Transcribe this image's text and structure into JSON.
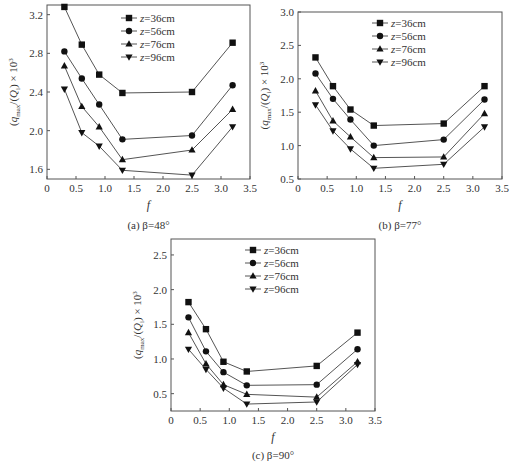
{
  "figure": {
    "panels": [
      "a",
      "b",
      "c"
    ]
  },
  "chart_data": [
    {
      "type": "line",
      "caption": "(a) β=48°",
      "xlabel": "f",
      "ylabel": "(q_max/Q_i) × 10^3",
      "xlim": [
        0,
        3.5
      ],
      "ylim": [
        1.5,
        3.3
      ],
      "xticks": [
        "0",
        "0.5",
        "1.0",
        "1.5",
        "2.0",
        "2.5",
        "3.0",
        "3.5"
      ],
      "yticks": [
        "1.6",
        "2.0",
        "2.4",
        "2.8",
        "3.2"
      ],
      "grid": false,
      "legend_position": "upper center",
      "x": [
        0.3,
        0.6,
        0.9,
        1.3,
        2.5,
        3.2
      ],
      "series": [
        {
          "name": "z=36cm",
          "marker": "square",
          "values": [
            3.28,
            2.89,
            2.58,
            2.39,
            2.4,
            2.91
          ]
        },
        {
          "name": "z=56cm",
          "marker": "circle",
          "values": [
            2.82,
            2.54,
            2.27,
            1.91,
            1.95,
            2.47
          ]
        },
        {
          "name": "z=76cm",
          "marker": "triangle-up",
          "values": [
            2.67,
            2.25,
            2.04,
            1.7,
            1.8,
            2.22
          ]
        },
        {
          "name": "z=96cm",
          "marker": "triangle-down",
          "values": [
            2.43,
            1.98,
            1.84,
            1.59,
            1.54,
            2.04
          ]
        }
      ]
    },
    {
      "type": "line",
      "caption": "(b) β=77°",
      "xlabel": "f",
      "ylabel": "(q_max/Q_i) × 10^3",
      "xlim": [
        0,
        3.5
      ],
      "ylim": [
        0.5,
        3.0
      ],
      "xticks": [
        "0",
        "0.5",
        "1.0",
        "1.5",
        "2.0",
        "2.5",
        "3.0",
        "3.5"
      ],
      "yticks": [
        "0.5",
        "1.0",
        "1.5",
        "2.0",
        "2.5",
        "3.0"
      ],
      "grid": false,
      "legend_position": "upper center",
      "x": [
        0.3,
        0.6,
        0.9,
        1.3,
        2.5,
        3.2
      ],
      "series": [
        {
          "name": "z=36cm",
          "marker": "square",
          "values": [
            2.32,
            1.89,
            1.54,
            1.3,
            1.33,
            1.89
          ]
        },
        {
          "name": "z=56cm",
          "marker": "circle",
          "values": [
            2.08,
            1.7,
            1.39,
            1.0,
            1.09,
            1.69
          ]
        },
        {
          "name": "z=76cm",
          "marker": "triangle-up",
          "values": [
            1.82,
            1.37,
            1.13,
            0.82,
            0.83,
            1.48
          ]
        },
        {
          "name": "z=96cm",
          "marker": "triangle-down",
          "values": [
            1.61,
            1.22,
            0.95,
            0.66,
            0.72,
            1.28
          ]
        }
      ]
    },
    {
      "type": "line",
      "caption": "(c) β=90°",
      "xlabel": "f",
      "ylabel": "(q_max/Q_i) × 10^3",
      "xlim": [
        0,
        3.5
      ],
      "ylim": [
        0.25,
        2.73
      ],
      "xticks": [
        "0",
        "0.5",
        "1.0",
        "1.5",
        "2.0",
        "2.5",
        "3.0",
        "3.5"
      ],
      "yticks": [
        "0.5",
        "1.0",
        "1.5",
        "2.0",
        "2.5"
      ],
      "grid": false,
      "legend_position": "upper center",
      "x": [
        0.3,
        0.6,
        0.9,
        1.3,
        2.5,
        3.2
      ],
      "series": [
        {
          "name": "z=36cm",
          "marker": "square",
          "values": [
            1.82,
            1.43,
            0.96,
            0.82,
            0.9,
            1.38
          ]
        },
        {
          "name": "z=56cm",
          "marker": "circle",
          "values": [
            1.6,
            1.11,
            0.81,
            0.62,
            0.63,
            1.14
          ]
        },
        {
          "name": "z=76cm",
          "marker": "triangle-up",
          "values": [
            1.38,
            0.93,
            0.63,
            0.49,
            0.45,
            0.96
          ]
        },
        {
          "name": "z=96cm",
          "marker": "triangle-down",
          "values": [
            1.14,
            0.85,
            0.58,
            0.35,
            0.38,
            0.92
          ]
        }
      ]
    }
  ],
  "layout": [
    {
      "left": 47,
      "top": 5,
      "right": 250,
      "bottom": 179
    },
    {
      "left": 298,
      "top": 12,
      "right": 502,
      "bottom": 179
    },
    {
      "left": 171,
      "top": 239,
      "right": 375,
      "bottom": 411
    }
  ],
  "colors": {
    "line": "#555555",
    "marker": "#111111",
    "axis": "#555555"
  }
}
